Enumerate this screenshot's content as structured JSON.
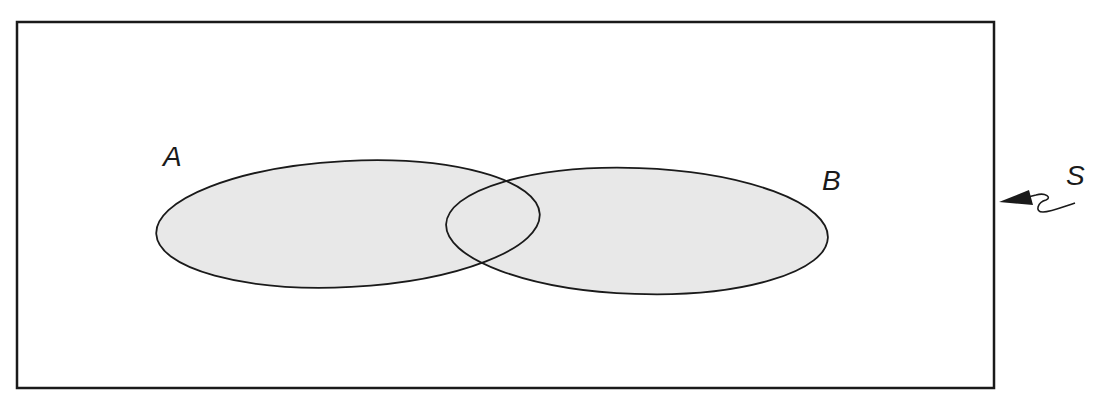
{
  "diagram": {
    "type": "venn",
    "universe_label": "S",
    "sets": [
      {
        "label": "A"
      },
      {
        "label": "B"
      }
    ],
    "colors": {
      "fill": "#e8e8e8",
      "stroke": "#1a1a1a",
      "background": "#ffffff"
    }
  }
}
